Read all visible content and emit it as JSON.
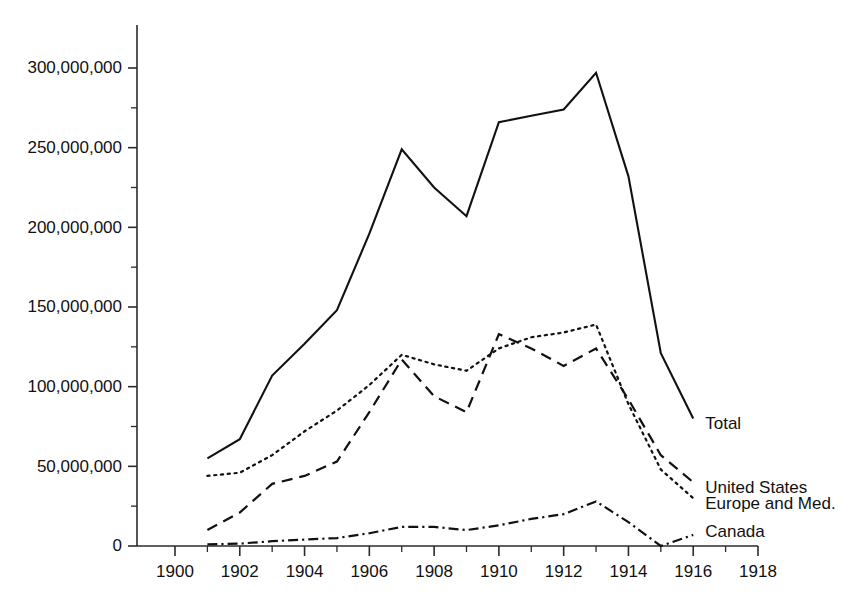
{
  "chart_data": {
    "type": "line",
    "title": "",
    "xlabel": "",
    "ylabel": "",
    "xlim": [
      1899,
      1918
    ],
    "ylim": [
      0,
      312500000
    ],
    "grid": false,
    "legend_position": "right-inline-end-of-line",
    "x_tick_labels": [
      "1900",
      "1902",
      "1904",
      "1906",
      "1908",
      "1910",
      "1912",
      "1914",
      "1916",
      "1918"
    ],
    "x_ticks": [
      1900,
      1902,
      1904,
      1906,
      1908,
      1910,
      1912,
      1914,
      1916,
      1918
    ],
    "x_minor_ticks": [
      1901,
      1903,
      1905,
      1907,
      1909,
      1911,
      1913,
      1915,
      1917
    ],
    "y_tick_labels": [
      "0",
      "50,000,000",
      "100,000,000",
      "150,000,000",
      "200,000,000",
      "250,000,000",
      "300,000,000"
    ],
    "y_ticks": [
      0,
      50000000,
      100000000,
      150000000,
      200000000,
      250000000,
      300000000
    ],
    "y_minor_ticks": [
      25000000,
      75000000,
      125000000,
      175000000,
      225000000,
      275000000
    ],
    "x": [
      1901,
      1902,
      1903,
      1904,
      1905,
      1906,
      1907,
      1908,
      1909,
      1910,
      1911,
      1912,
      1913,
      1914,
      1915,
      1916
    ],
    "series": [
      {
        "name": "Total",
        "label": "Total",
        "line_style": "solid",
        "values": [
          55000000,
          67000000,
          107000000,
          127000000,
          148000000,
          196000000,
          249000000,
          225000000,
          207000000,
          266000000,
          270000000,
          274000000,
          297000000,
          232000000,
          121000000,
          80000000
        ]
      },
      {
        "name": "United States",
        "label": "United States",
        "line_style": "dashed",
        "values": [
          10000000,
          21000000,
          39000000,
          44000000,
          53000000,
          84000000,
          117000000,
          94000000,
          84000000,
          133000000,
          124000000,
          113000000,
          124000000,
          92000000,
          57000000,
          40000000
        ]
      },
      {
        "name": "Europe and Med.",
        "label": "Europe and Med.",
        "line_style": "dotted",
        "values": [
          44000000,
          46000000,
          57000000,
          72000000,
          85000000,
          101000000,
          120000000,
          114000000,
          110000000,
          124000000,
          131000000,
          134000000,
          139000000,
          89000000,
          48000000,
          30000000
        ]
      },
      {
        "name": "Canada",
        "label": "Canada",
        "line_style": "dash-dot",
        "values": [
          1000000,
          1500000,
          3000000,
          4000000,
          5000000,
          8000000,
          12000000,
          12000000,
          10000000,
          13000000,
          17000000,
          20000000,
          28000000,
          15000000,
          0,
          7000000
        ]
      }
    ]
  },
  "colors": {
    "ink": "#111111",
    "axis": "#2b2b2b",
    "background": "#ffffff"
  }
}
